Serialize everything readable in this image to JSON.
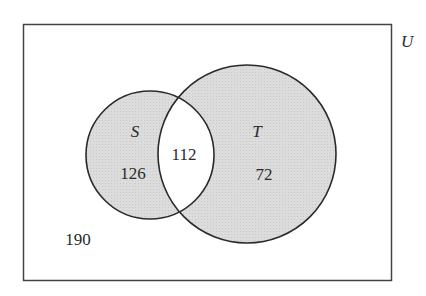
{
  "diagram": {
    "type": "venn",
    "universe_label": "U",
    "sets": [
      {
        "label": "S",
        "only_count": "126"
      },
      {
        "label": "T",
        "only_count": "72"
      }
    ],
    "intersection_count": "112",
    "outside_count": "190",
    "colors": {
      "shade": "#d9d9d9",
      "stroke": "#2a2a2a",
      "background": "#ffffff"
    }
  }
}
